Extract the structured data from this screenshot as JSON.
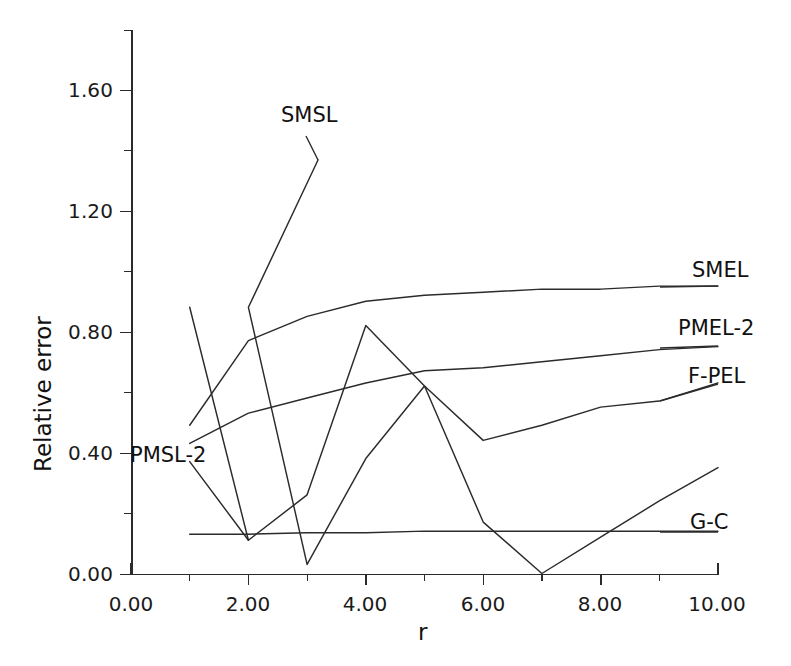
{
  "chart_data": {
    "type": "line",
    "title": "",
    "xlabel": "r",
    "ylabel": "Relative error",
    "xlim": [
      0,
      10
    ],
    "ylim": [
      0,
      1.75
    ],
    "grid": false,
    "legend_position": "inline-right-end-labels",
    "x_ticks": [
      "0.00",
      "2.00",
      "4.00",
      "6.00",
      "8.00",
      "10.00"
    ],
    "x_tick_values": [
      0,
      2,
      4,
      6,
      8,
      10
    ],
    "x_minor_tick_values": [
      1,
      3,
      5,
      7,
      9
    ],
    "y_ticks": [
      "0.00",
      "0.40",
      "0.80",
      "1.20",
      "1.60"
    ],
    "y_tick_values": [
      0.0,
      0.4,
      0.8,
      1.2,
      1.6
    ],
    "y_minor_tick_values": [
      0.2,
      0.6,
      1.0,
      1.4
    ],
    "x": [
      1,
      2,
      3,
      4,
      5,
      6,
      7,
      8,
      9,
      10
    ],
    "series": [
      {
        "name": "SMSL",
        "values": [
          1.75,
          0.88,
          0.03,
          0.38,
          0.62,
          0.17,
          0.0,
          0.12,
          0.24,
          0.35
        ],
        "label_text": "SMSL"
      },
      {
        "name": "SMEL",
        "values": [
          0.49,
          0.77,
          0.85,
          0.9,
          0.92,
          0.93,
          0.94,
          0.94,
          0.95,
          0.95
        ],
        "label_text": "SMEL"
      },
      {
        "name": "PMEL-2",
        "values": [
          0.43,
          0.53,
          0.58,
          0.63,
          0.67,
          0.68,
          0.7,
          0.72,
          0.74,
          0.75
        ],
        "label_text": "PMEL-2"
      },
      {
        "name": "F-PEL",
        "values": [
          0.88,
          0.11,
          0.26,
          0.82,
          0.62,
          0.44,
          0.49,
          0.55,
          0.57,
          0.63
        ],
        "label_text": "F-PEL"
      },
      {
        "name": "PMSL-2",
        "values": [
          0.37,
          0.11,
          0.26,
          0.82,
          0.62,
          0.44,
          0.49,
          0.55,
          0.57,
          0.63
        ],
        "label_text": "PMSL-2"
      },
      {
        "name": "G-C",
        "values": [
          0.13,
          0.13,
          0.135,
          0.135,
          0.14,
          0.14,
          0.14,
          0.14,
          0.14,
          0.14
        ],
        "label_text": "G-C"
      }
    ],
    "colors": {
      "line": "#2b2b2b",
      "axis": "#2b2b2b",
      "background": "#ffffff",
      "text": "#1a1a1a"
    }
  },
  "axes": {
    "y_title": "Relative error",
    "x_title": "r"
  },
  "labels": {
    "smsl": "SMSL",
    "smel": "SMEL",
    "pmel2": "PMEL-2",
    "fpel": "F-PEL",
    "pmsl2": "PMSL-2",
    "gc": "G-C"
  },
  "y_tick_labels": [
    "1.60",
    "1.20",
    "0.80",
    "0.40",
    "0.00"
  ],
  "x_tick_labels": [
    "0.00",
    "2.00",
    "4.00",
    "6.00",
    "8.00",
    "10.00"
  ]
}
